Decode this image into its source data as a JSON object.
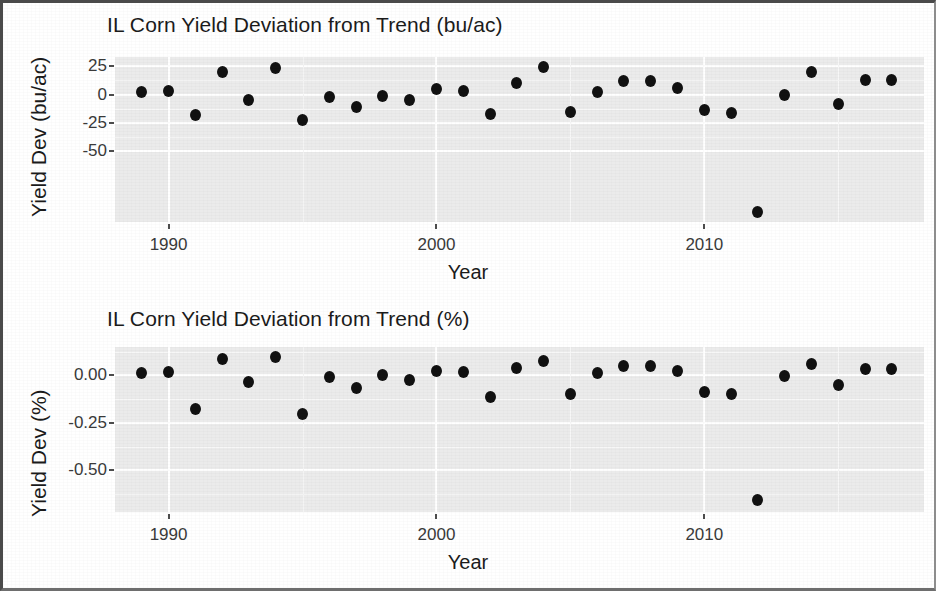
{
  "chart_data": [
    {
      "type": "scatter",
      "id": "bu_ac",
      "title": "IL Corn Yield Deviation from Trend (bu/ac)",
      "xlabel": "Year",
      "ylabel": "Yield Dev (bu/ac)",
      "xlim": [
        1988.0,
        2018.2
      ],
      "ylim": [
        -112,
        33
      ],
      "xticks": [
        1990,
        2000,
        2010
      ],
      "xtick_labels": [
        "1990",
        "2000",
        "2010"
      ],
      "yticks": [
        25,
        0,
        -25,
        -50
      ],
      "ytick_labels": [
        "25",
        "0",
        "-25",
        "-50"
      ],
      "grid": true,
      "legend": "none",
      "marker_color": "#111111",
      "panel_color": "#ebebeb",
      "x": [
        1989,
        1990,
        1991,
        1992,
        1993,
        1994,
        1995,
        1996,
        1997,
        1998,
        1999,
        2000,
        2001,
        2002,
        2003,
        2004,
        2005,
        2006,
        2007,
        2008,
        2009,
        2010,
        2011,
        2012,
        2013,
        2014,
        2015,
        2016,
        2017
      ],
      "values": [
        2,
        3,
        -18,
        20,
        -5,
        23,
        -22,
        -2,
        -11,
        -1,
        -5,
        5,
        3,
        -17,
        10,
        24,
        -15,
        2,
        12,
        12,
        6,
        -14,
        -16,
        -103,
        0,
        20,
        -8,
        13,
        13
      ]
    },
    {
      "type": "scatter",
      "id": "pct",
      "title": "IL Corn Yield Deviation from Trend (%)",
      "xlabel": "Year",
      "ylabel": "Yield Dev (%)",
      "xlim": [
        1988.0,
        2018.2
      ],
      "ylim": [
        -0.72,
        0.15
      ],
      "xticks": [
        1990,
        2000,
        2010
      ],
      "xtick_labels": [
        "1990",
        "2000",
        "2010"
      ],
      "yticks": [
        0.0,
        -0.25,
        -0.5
      ],
      "ytick_labels": [
        "0.00",
        "-0.25",
        "-0.50"
      ],
      "grid": true,
      "legend": "none",
      "marker_color": "#111111",
      "panel_color": "#ebebeb",
      "x": [
        1989,
        1990,
        1991,
        1992,
        1993,
        1994,
        1995,
        1996,
        1997,
        1998,
        1999,
        2000,
        2001,
        2002,
        2003,
        2004,
        2005,
        2006,
        2007,
        2008,
        2009,
        2010,
        2011,
        2012,
        2013,
        2014,
        2015,
        2016,
        2017
      ],
      "values": [
        0.015,
        0.018,
        -0.175,
        0.085,
        -0.035,
        0.095,
        -0.205,
        -0.01,
        -0.065,
        0.0,
        -0.025,
        0.025,
        0.02,
        -0.115,
        0.04,
        0.075,
        -0.1,
        0.012,
        0.05,
        0.05,
        0.022,
        -0.085,
        -0.1,
        -0.655,
        -0.005,
        0.06,
        -0.05,
        0.035,
        0.032
      ]
    }
  ]
}
